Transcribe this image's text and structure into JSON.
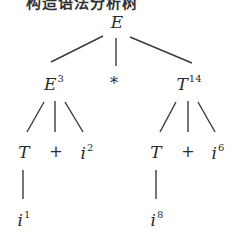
{
  "header_clipped_text": "构造语法分析树",
  "diagram": {
    "type": "parse-tree",
    "line_color": "#3a3a3a",
    "nodes": [
      {
        "id": "root",
        "symbol": "E",
        "index": "",
        "x": 117,
        "y": 22
      },
      {
        "id": "e3",
        "symbol": "E",
        "index": "3",
        "x": 54,
        "y": 83
      },
      {
        "id": "star",
        "symbol": "*",
        "index": "",
        "x": 114,
        "y": 84
      },
      {
        "id": "t14",
        "symbol": "T",
        "index": "14",
        "x": 189,
        "y": 83
      },
      {
        "id": "t_left",
        "symbol": "T",
        "index": "",
        "x": 24,
        "y": 152
      },
      {
        "id": "plus_left",
        "symbol": "+",
        "index": "",
        "x": 56,
        "y": 152
      },
      {
        "id": "i2",
        "symbol": "i",
        "index": "2",
        "x": 87,
        "y": 152
      },
      {
        "id": "t_right",
        "symbol": "T",
        "index": "",
        "x": 156,
        "y": 152
      },
      {
        "id": "plus_right",
        "symbol": "+",
        "index": "",
        "x": 188,
        "y": 152
      },
      {
        "id": "i6",
        "symbol": "i",
        "index": "6",
        "x": 218,
        "y": 152
      },
      {
        "id": "i1",
        "symbol": "i",
        "index": "1",
        "x": 24,
        "y": 219
      },
      {
        "id": "i8",
        "symbol": "i",
        "index": "8",
        "x": 157,
        "y": 219
      }
    ],
    "edges": [
      {
        "from": "root",
        "to": "e3",
        "x1": 103,
        "y1": 36,
        "x2": 51,
        "y2": 62
      },
      {
        "from": "root",
        "to": "star",
        "x1": 116,
        "y1": 38,
        "x2": 116,
        "y2": 66
      },
      {
        "from": "root",
        "to": "t14",
        "x1": 130,
        "y1": 37,
        "x2": 192,
        "y2": 63
      },
      {
        "from": "e3",
        "to": "t_left",
        "x1": 44,
        "y1": 102,
        "x2": 27,
        "y2": 132
      },
      {
        "from": "e3",
        "to": "plus_left",
        "x1": 55,
        "y1": 101,
        "x2": 55,
        "y2": 132
      },
      {
        "from": "e3",
        "to": "i2",
        "x1": 65,
        "y1": 102,
        "x2": 83,
        "y2": 132
      },
      {
        "from": "t14",
        "to": "t_right",
        "x1": 176,
        "y1": 102,
        "x2": 160,
        "y2": 132
      },
      {
        "from": "t14",
        "to": "plus_right",
        "x1": 188,
        "y1": 101,
        "x2": 188,
        "y2": 132
      },
      {
        "from": "t14",
        "to": "i6",
        "x1": 198,
        "y1": 102,
        "x2": 215,
        "y2": 132
      },
      {
        "from": "t_left",
        "to": "i1",
        "x1": 23,
        "y1": 170,
        "x2": 23,
        "y2": 199
      },
      {
        "from": "t_right",
        "to": "i8",
        "x1": 156,
        "y1": 170,
        "x2": 156,
        "y2": 199
      }
    ]
  }
}
